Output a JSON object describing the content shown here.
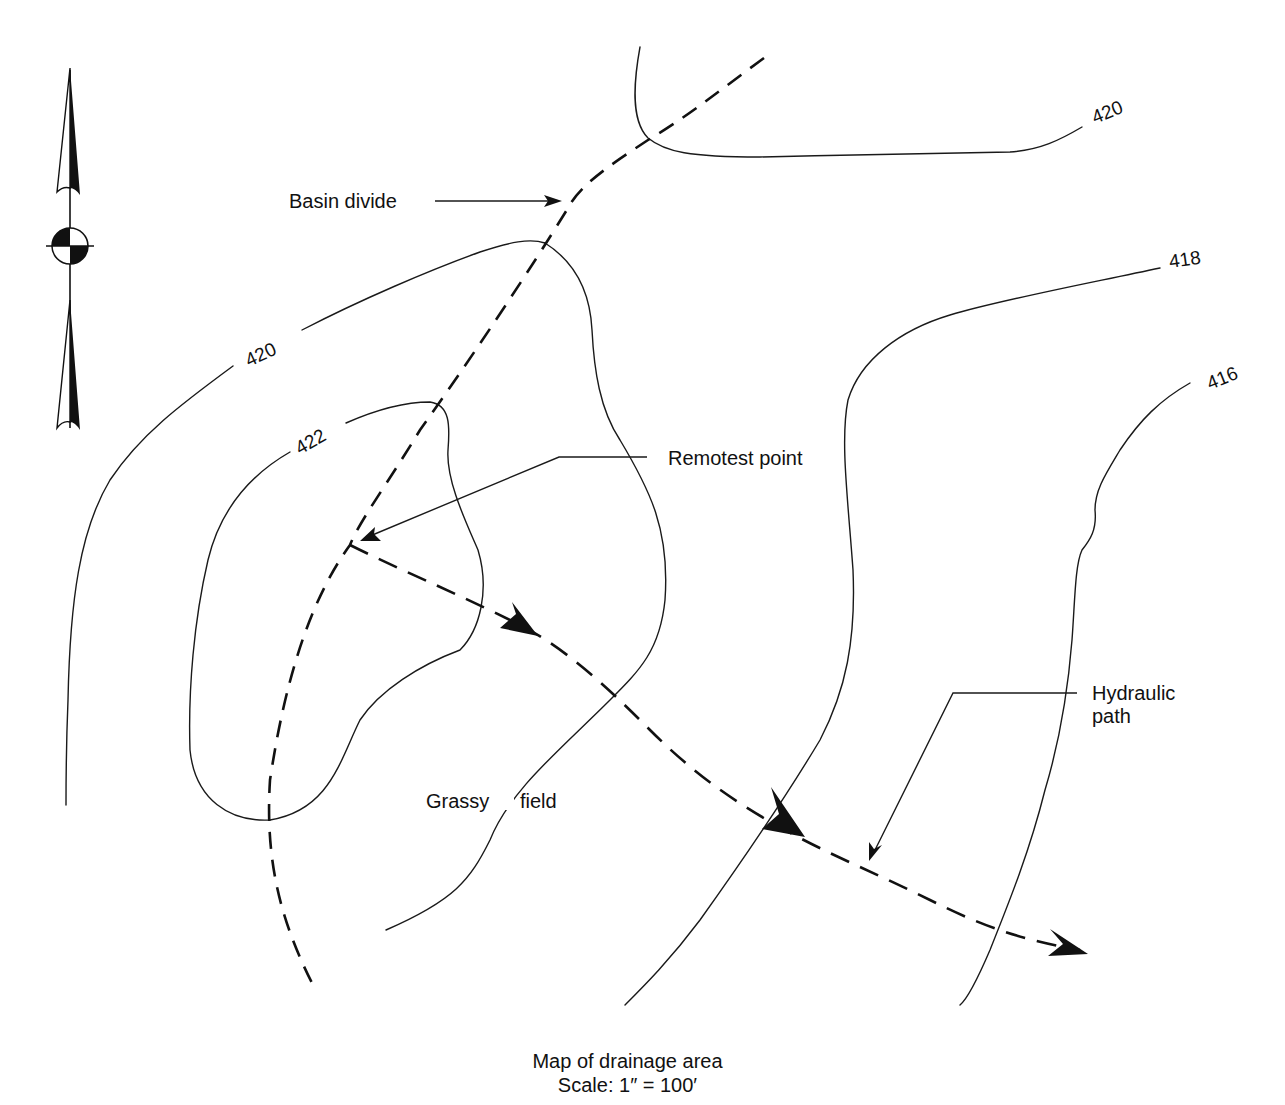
{
  "map": {
    "title": "Map of drainage area",
    "scale": "Scale: 1″ = 100′"
  },
  "contour_labels": {
    "c420_top": "420",
    "c420_left": "420",
    "c422": "422",
    "c418": "418",
    "c416": "416"
  },
  "annotations": {
    "basin_divide": "Basin divide",
    "remotest_point": "Remotest point",
    "hydraulic_path_line1": "Hydraulic",
    "hydraulic_path_line2": "path",
    "grassy": "Grassy",
    "field": "field"
  },
  "icons": {
    "north_arrow": "north-arrow-with-benchmark-symbol"
  },
  "colors": {
    "ink": "#111111",
    "background": "#ffffff"
  }
}
